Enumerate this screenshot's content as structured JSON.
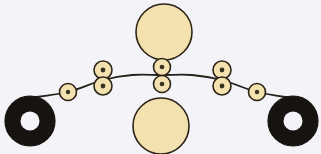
{
  "figure": {
    "canvas": {
      "width": 321,
      "height": 154
    },
    "background_color": "#f4f4f8",
    "palette": {
      "bead_fill": "#f3e1b0",
      "bead_stroke": "#2b2417",
      "bead_pupil": "#3a3020",
      "disc_fill": "#f3e1b0",
      "disc_stroke": "#2b2417",
      "ring_fill": "#171310",
      "ring_hole_fill": "#f4f4f8",
      "curve_stroke": "#25211a"
    },
    "stroke_widths": {
      "bead": 1.6,
      "disc": 1.6,
      "ring": 1.2,
      "curve": 1.8
    }
  },
  "chart_data": {
    "type": "scatter",
    "xlabel": "",
    "ylabel": "",
    "xlim": [
      0,
      321
    ],
    "ylim": [
      0,
      154
    ],
    "grid": false,
    "legend": "none",
    "curve": {
      "name": "arc-curve",
      "description": "Shallow arc spanning left ring to right ring, apex near center",
      "points": [
        {
          "x": 29,
          "y": 98
        },
        {
          "x": 68,
          "y": 92
        },
        {
          "x": 103,
          "y": 80
        },
        {
          "x": 132,
          "y": 75
        },
        {
          "x": 162,
          "y": 75
        },
        {
          "x": 192,
          "y": 75
        },
        {
          "x": 222,
          "y": 80
        },
        {
          "x": 257,
          "y": 92
        },
        {
          "x": 292,
          "y": 98
        }
      ]
    },
    "series": [
      {
        "name": "large-discs",
        "marker": "circle",
        "fill": "#f3e1b0",
        "stroke": "#2b2417",
        "points": [
          {
            "id": "disc-top",
            "x": 164,
            "y": 32,
            "r": 28
          },
          {
            "id": "disc-bottom",
            "x": 161,
            "y": 126,
            "r": 28
          }
        ]
      },
      {
        "name": "beads",
        "marker": "circle-with-dot",
        "fill": "#f3e1b0",
        "stroke": "#2b2417",
        "points": [
          {
            "id": "bead-left-outer",
            "x": 68,
            "y": 92,
            "r": 8.5,
            "dot_r": 2.2
          },
          {
            "id": "bead-left-pair-top",
            "x": 103,
            "y": 70,
            "r": 9,
            "dot_r": 2.4
          },
          {
            "id": "bead-left-pair-bottom",
            "x": 103,
            "y": 86,
            "r": 9,
            "dot_r": 2.4
          },
          {
            "id": "bead-center-top",
            "x": 162,
            "y": 67,
            "r": 8.5,
            "dot_r": 2.3
          },
          {
            "id": "bead-center-bottom",
            "x": 162,
            "y": 84,
            "r": 8.5,
            "dot_r": 2.3
          },
          {
            "id": "bead-right-pair-top",
            "x": 222,
            "y": 70,
            "r": 9,
            "dot_r": 2.4
          },
          {
            "id": "bead-right-pair-bottom",
            "x": 222,
            "y": 86,
            "r": 9,
            "dot_r": 2.4
          },
          {
            "id": "bead-right-outer",
            "x": 257,
            "y": 92,
            "r": 8.5,
            "dot_r": 2.2
          }
        ]
      },
      {
        "name": "end-rings",
        "marker": "annulus",
        "fill": "#171310",
        "points": [
          {
            "id": "ring-left",
            "x": 30,
            "y": 121,
            "r_outer": 25,
            "r_inner": 9.5
          },
          {
            "id": "ring-right",
            "x": 293,
            "y": 121,
            "r_outer": 25,
            "r_inner": 9.5
          }
        ]
      }
    ]
  }
}
